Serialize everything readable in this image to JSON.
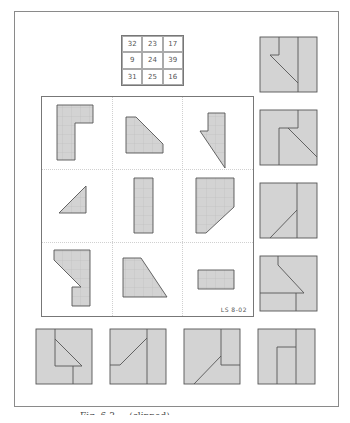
{
  "figure": {
    "magic_square": {
      "rows": [
        [
          "32",
          "23",
          "17"
        ],
        [
          "9",
          "24",
          "39"
        ],
        [
          "31",
          "25",
          "16"
        ]
      ]
    },
    "inner_panel": {
      "label": "LS 8-02",
      "pieces": [
        {
          "name": "L-shape",
          "row": 0,
          "col": 0
        },
        {
          "name": "trapezoid-cut",
          "row": 0,
          "col": 1
        },
        {
          "name": "hook-triangle",
          "row": 0,
          "col": 2
        },
        {
          "name": "small-triangle",
          "row": 1,
          "col": 0
        },
        {
          "name": "tall-rectangle",
          "row": 1,
          "col": 1
        },
        {
          "name": "chamfered-rectangle",
          "row": 1,
          "col": 2
        },
        {
          "name": "notched-bar",
          "row": 2,
          "col": 0
        },
        {
          "name": "right-trapezoid",
          "row": 2,
          "col": 1
        },
        {
          "name": "small-rectangle",
          "row": 2,
          "col": 2
        }
      ]
    },
    "solution_squares_right": 4,
    "solution_squares_bottom": 4,
    "colors": {
      "piece_fill": "#d3d3d3",
      "piece_stroke": "#555555",
      "frame": "#8a8a8a"
    },
    "caption": "Fig. 6.3 ... (clipped)"
  }
}
